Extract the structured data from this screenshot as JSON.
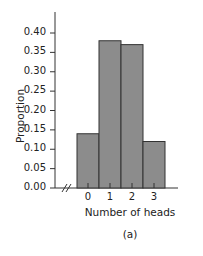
{
  "chart_data": {
    "type": "bar",
    "title": "",
    "xlabel": "Number of heads",
    "ylabel": "Proportion",
    "caption": "(a)",
    "categories": [
      "0",
      "1",
      "2",
      "3"
    ],
    "values": [
      0.14,
      0.38,
      0.37,
      0.12
    ],
    "ylim": [
      0.0,
      0.42
    ],
    "yticks": [
      "0.00",
      "0.05",
      "0.10",
      "0.15",
      "0.20",
      "0.25",
      "0.30",
      "0.35",
      "0.40"
    ],
    "grid": false,
    "axis_break": true,
    "bar_color": "#8c8c8c",
    "bar_edge_color": "#333333"
  }
}
